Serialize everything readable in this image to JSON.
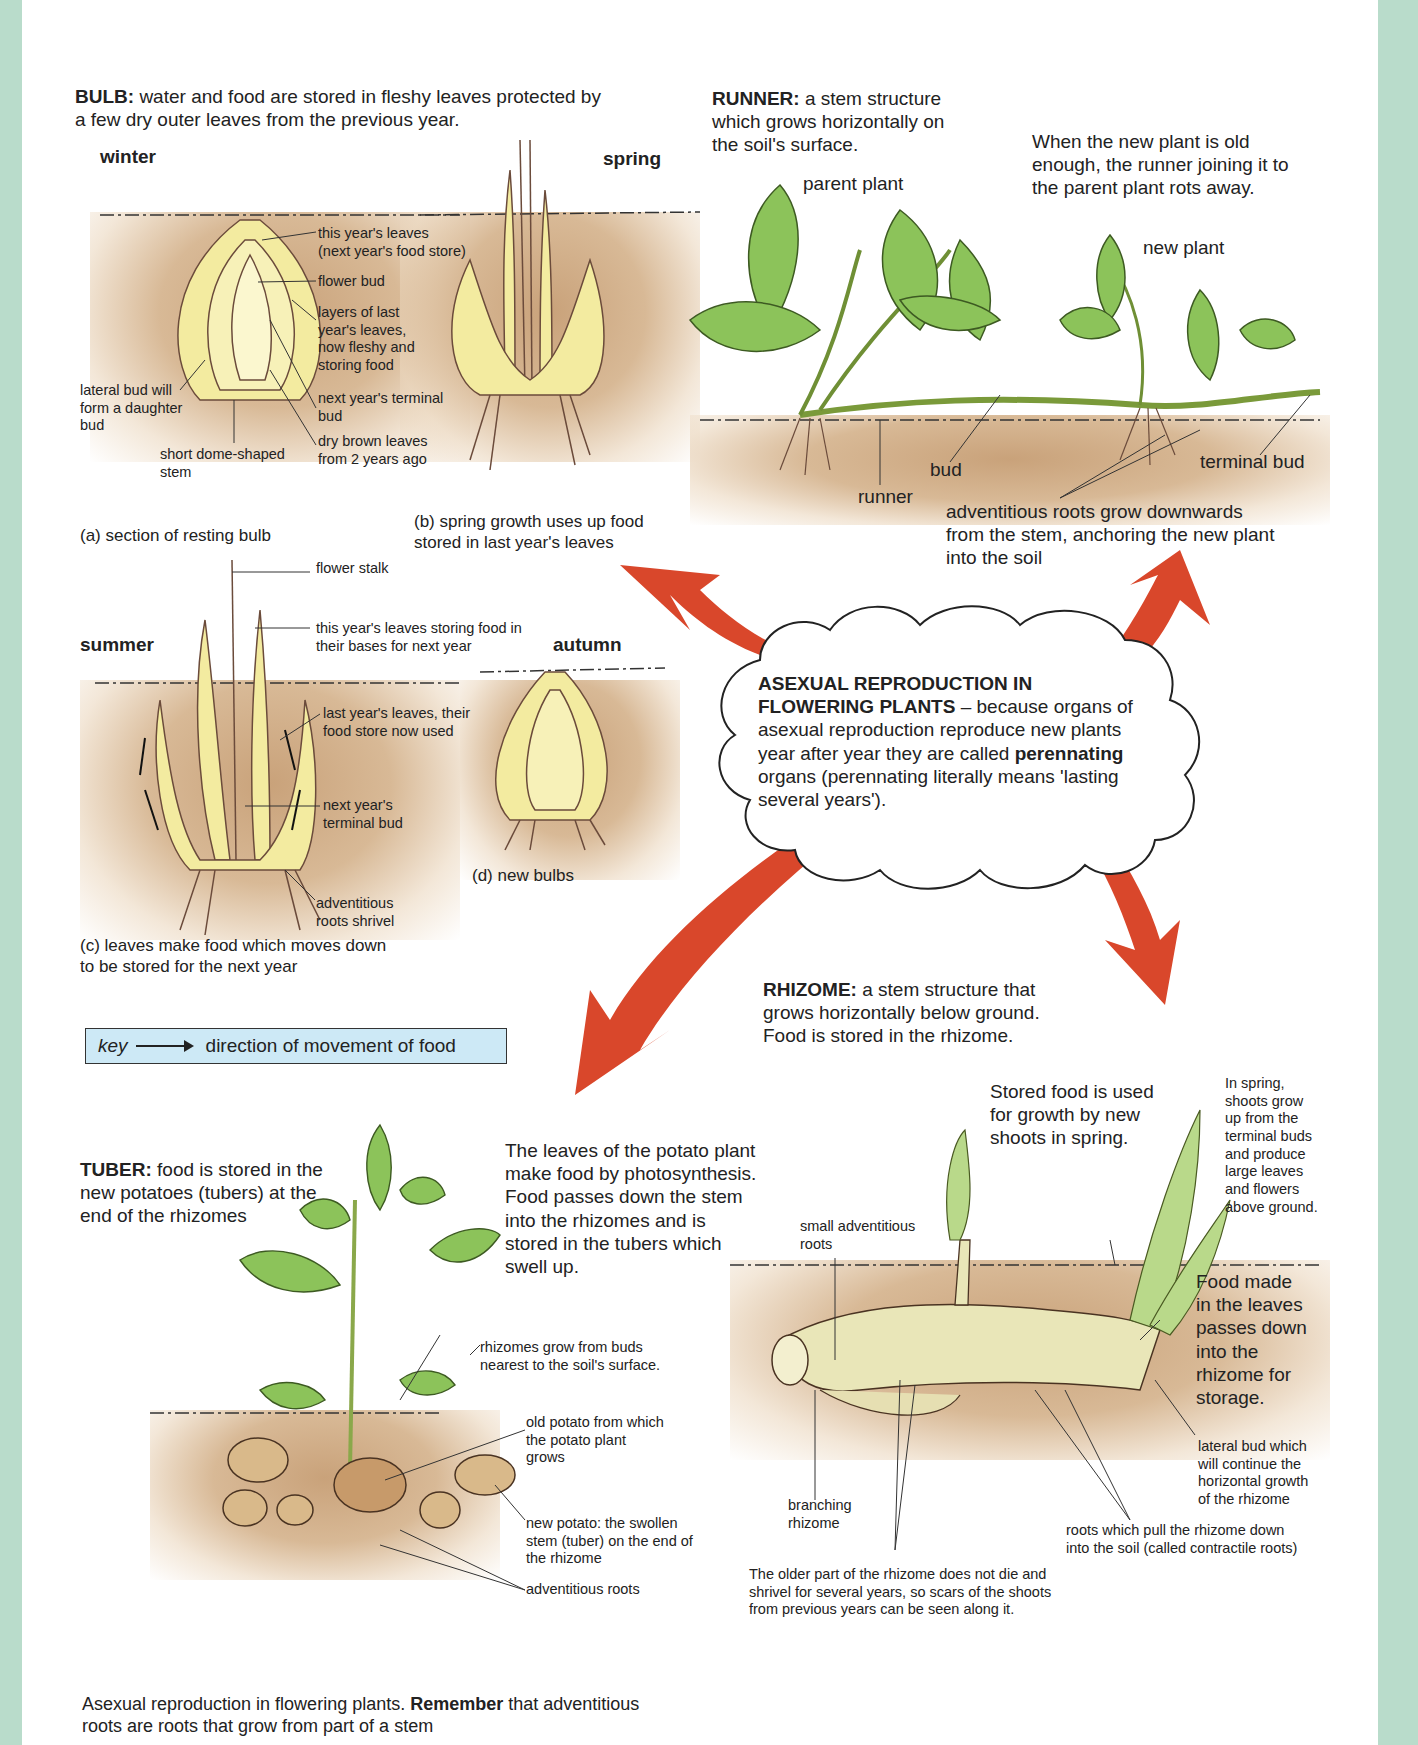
{
  "bulb": {
    "heading_bold": "BULB:",
    "heading_text": " water and food are stored in fleshy leaves protected by\na few dry outer leaves from the previous year.",
    "season_winter": "winter",
    "season_spring": "spring",
    "season_summer": "summer",
    "season_autumn": "autumn",
    "labels_a": {
      "this_years_leaves": "this year's leaves\n(next year's food store)",
      "flower_bud": "flower bud",
      "layers": "layers of last\nyear's leaves,\nnow fleshy and\nstoring food",
      "next_terminal": "next year's terminal\nbud",
      "dry_brown": "dry brown leaves\nfrom 2 years ago",
      "lateral_bud": "lateral bud will\nform a daughter\nbud",
      "short_stem": "short dome-shaped\nstem"
    },
    "caption_a": "(a) section of resting bulb",
    "caption_b": "(b) spring growth uses up food\nstored in last year's leaves",
    "labels_c": {
      "flower_stalk": "flower stalk",
      "this_years_storing": "this year's leaves storing food in\ntheir bases for next year",
      "last_years_used": "last year's leaves, their\nfood store now used",
      "next_terminal": "next year's\nterminal bud",
      "roots_shrivel": "adventitious\nroots shrivel"
    },
    "caption_c": "(c) leaves make food which moves down\nto be stored for the next year",
    "caption_d": "(d) new bulbs"
  },
  "key": {
    "label": "key",
    "text": "direction of movement of food"
  },
  "runner": {
    "heading_bold": "RUNNER:",
    "heading_text": " a stem structure\nwhich grows horizontally on\nthe soil's surface.",
    "rot_note": "When the new plant is old\nenough, the runner joining it to\nthe parent plant rots away.",
    "parent_plant": "parent plant",
    "new_plant": "new plant",
    "bud": "bud",
    "runner_label": "runner",
    "terminal_bud": "terminal bud",
    "adventitious": "adventitious roots grow downwards\nfrom the stem, anchoring the new plant\ninto the soil"
  },
  "center": {
    "title_bold": "ASEXUAL REPRODUCTION IN\nFLOWERING PLANTS",
    "text_1": " – because organs of\nasexual reproduction reproduce new plants\nyear after year they are called ",
    "text_bold": "perennating",
    "text_2": "\norgans (perennating literally means 'lasting\nseveral years')."
  },
  "tuber": {
    "heading_bold": "TUBER:",
    "heading_text": " food is stored in the\nnew potatoes (tubers) at the\nend of the rhizomes",
    "leaves_note": "The leaves of the potato plant\nmake food by photosynthesis.\nFood passes down the stem\ninto the rhizomes and is\nstored in the tubers which\nswell up.",
    "rhizomes_grow": "rhizomes grow from buds\nnearest to the soil's surface.",
    "old_potato": "old potato from which\nthe potato plant\ngrows",
    "new_potato": "new potato: the swollen\nstem (tuber) on the end of\nthe rhizome",
    "adventitious": "adventitious roots"
  },
  "rhizome": {
    "heading_bold": "RHIZOME:",
    "heading_text": " a stem structure that\ngrows horizontally below ground.\nFood is stored in the rhizome.",
    "stored_food": "Stored food is used\nfor growth by new\nshoots in spring.",
    "in_spring": "In spring,\nshoots grow\nup from the\nterminal buds\nand produce\nlarge leaves\nand flowers\nabove ground.",
    "small_roots": "small adventitious\nroots",
    "food_made": "Food made\nin the leaves\npasses down\ninto the\nrhizome for\nstorage.",
    "lateral_bud": "lateral bud which\nwill continue the\nhorizontal growth\nof the rhizome",
    "branching": "branching\nrhizome",
    "contractile": "roots which pull the rhizome down\ninto the soil (called contractile roots)",
    "older_part": "The older part of the rhizome does not die and\nshrivel for several years, so scars of the shoots\nfrom previous years can be seen along it."
  },
  "footer": {
    "text_1": "Asexual reproduction in flowering plants. ",
    "text_bold": "Remember",
    "text_2": " that adventitious\nroots are roots that grow from part of a stem"
  },
  "colors": {
    "arrow": "#d9472b",
    "soil": "#c9a27a",
    "leaf": "#8cc35a",
    "bulb_yellow": "#f3eba0",
    "band": "#b9dccb",
    "key_bg": "#cde9f6"
  }
}
